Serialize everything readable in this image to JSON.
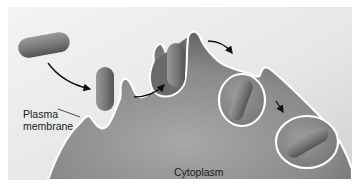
{
  "diagram": {
    "labels": {
      "plasma_membrane_line1": "Plasma",
      "plasma_membrane_line2": "membrane",
      "cytoplasm": "Cytoplasm"
    },
    "stages": [
      "Particle outside cell",
      "Particle contacts plasma membrane",
      "Membrane invaginates around particle",
      "Vesicle pinches off",
      "Vesicle moves into cytoplasm"
    ],
    "colors": {
      "background_light": "#f2f2f2",
      "background_mid": "#d8d8d8",
      "cell_dark": "#6e6e6e",
      "cell_mid": "#8c8c8c",
      "membrane": "#ffffff",
      "particle": "#7a7a7a",
      "arrow": "#111111",
      "text": "#1a1a1a"
    }
  }
}
